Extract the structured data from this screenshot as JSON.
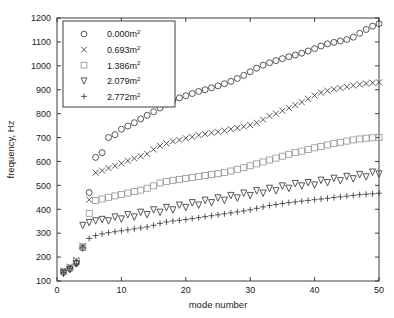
{
  "chart_data": {
    "type": "scatter",
    "title": "",
    "xlabel": "mode number",
    "ylabel": "frequency, Hz",
    "xlim": [
      0,
      50
    ],
    "ylim": [
      100,
      1200
    ],
    "xticks": [
      0,
      10,
      20,
      30,
      40,
      50
    ],
    "yticks": [
      100,
      200,
      300,
      400,
      500,
      600,
      700,
      800,
      900,
      1000,
      1100,
      1200
    ],
    "grid": false,
    "legend_position": "upper-left",
    "legend_entries": [
      "0.000m2",
      "0.693m2",
      "1.386m2",
      "2.079m2",
      "2.772m2"
    ],
    "x": [
      1,
      2,
      3,
      4,
      5,
      6,
      7,
      8,
      9,
      10,
      11,
      12,
      13,
      14,
      15,
      16,
      17,
      18,
      19,
      20,
      21,
      22,
      23,
      24,
      25,
      26,
      27,
      28,
      29,
      30,
      31,
      32,
      33,
      34,
      35,
      36,
      37,
      38,
      39,
      40,
      41,
      42,
      43,
      44,
      45,
      46,
      47,
      48,
      49,
      50
    ],
    "series": [
      {
        "name": "0.000m2",
        "label_value": "0.000",
        "label_unit": "m",
        "label_exp": "2",
        "marker": "circle",
        "color": "#3a3a3a",
        "values": [
          138,
          152,
          175,
          238,
          470,
          617,
          637,
          700,
          712,
          735,
          748,
          762,
          778,
          793,
          808,
          824,
          840,
          855,
          866,
          875,
          884,
          893,
          900,
          908,
          916,
          925,
          935,
          947,
          960,
          975,
          990,
          1003,
          1013,
          1022,
          1030,
          1038,
          1045,
          1053,
          1062,
          1072,
          1083,
          1092,
          1098,
          1104,
          1110,
          1120,
          1136,
          1152,
          1166,
          1176
        ]
      },
      {
        "name": "0.693m2",
        "label_value": "0.693",
        "label_unit": "m",
        "label_exp": "2",
        "marker": "cross",
        "color": "#3a3a3a",
        "values": [
          143,
          160,
          188,
          248,
          440,
          553,
          562,
          572,
          582,
          592,
          603,
          613,
          622,
          632,
          650,
          665,
          675,
          684,
          690,
          697,
          703,
          710,
          715,
          720,
          724,
          729,
          735,
          740,
          746,
          752,
          762,
          775,
          790,
          800,
          812,
          824,
          836,
          848,
          862,
          876,
          888,
          896,
          902,
          907,
          912,
          918,
          922,
          926,
          929,
          931
        ]
      },
      {
        "name": "1.386m2",
        "label_value": "1.386",
        "label_unit": "m",
        "label_exp": "2",
        "marker": "square",
        "color": "#9a9a9a",
        "values": [
          140,
          155,
          182,
          243,
          383,
          437,
          443,
          450,
          456,
          462,
          468,
          474,
          480,
          488,
          498,
          510,
          516,
          521,
          525,
          529,
          533,
          537,
          541,
          545,
          549,
          554,
          560,
          567,
          574,
          582,
          590,
          598,
          606,
          614,
          622,
          630,
          637,
          643,
          650,
          657,
          663,
          669,
          675,
          680,
          685,
          690,
          694,
          697,
          699,
          700
        ]
      },
      {
        "name": "2.079m2",
        "label_value": "2.079",
        "label_unit": "m",
        "label_exp": "2",
        "marker": "triangle-down",
        "color": "#3a3a3a",
        "values": [
          132,
          148,
          172,
          333,
          345,
          352,
          358,
          352,
          368,
          360,
          378,
          368,
          388,
          378,
          398,
          388,
          408,
          398,
          418,
          408,
          428,
          418,
          438,
          428,
          448,
          438,
          458,
          448,
          468,
          458,
          478,
          468,
          488,
          478,
          498,
          488,
          508,
          498,
          512,
          502,
          522,
          512,
          530,
          520,
          538,
          528,
          546,
          536,
          556,
          548
        ]
      },
      {
        "name": "2.772m2",
        "label_value": "2.772",
        "label_unit": "m",
        "label_exp": "2",
        "marker": "plus",
        "color": "#3a3a3a",
        "values": [
          135,
          152,
          172,
          238,
          278,
          290,
          297,
          302,
          306,
          310,
          314,
          318,
          322,
          326,
          333,
          341,
          347,
          351,
          354,
          357,
          361,
          365,
          369,
          373,
          377,
          381,
          385,
          389,
          393,
          398,
          404,
          410,
          416,
          420,
          424,
          428,
          431,
          434,
          437,
          440,
          443,
          446,
          449,
          452,
          455,
          458,
          461,
          463,
          465,
          467
        ]
      }
    ]
  }
}
